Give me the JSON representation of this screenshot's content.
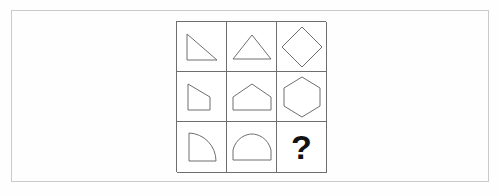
{
  "page": {
    "background_color": "#fefefe",
    "frame_color": "#c9cacc",
    "grid_line_color": "#6d6e70",
    "shape_stroke_color": "#6d6e70",
    "question_mark_color": "#121212"
  },
  "ghost_text": {
    "note": "faint scanner bleed-through from the reverse side of the page; illegible",
    "fragments": [
      "    ",
      "   ",
      "     ",
      "   ",
      "  ",
      "   ",
      "    ",
      "   "
    ]
  },
  "matrix": {
    "rows": 3,
    "columns": 3,
    "cells": [
      {
        "id": "r1c1",
        "row": 1,
        "column": 1,
        "shape": "right-triangle",
        "sides": 3,
        "label": "right triangle",
        "answer": false
      },
      {
        "id": "r1c2",
        "row": 1,
        "column": 2,
        "shape": "isosceles-triangle",
        "sides": 3,
        "label": "isosceles triangle",
        "answer": false
      },
      {
        "id": "r1c3",
        "row": 1,
        "column": 3,
        "shape": "diamond",
        "sides": 4,
        "label": "diamond",
        "answer": false
      },
      {
        "id": "r2c1",
        "row": 2,
        "column": 1,
        "shape": "trapezoid",
        "sides": 4,
        "label": "trapezoid",
        "answer": false
      },
      {
        "id": "r2c2",
        "row": 2,
        "column": 2,
        "shape": "pentagon",
        "sides": 5,
        "label": "pentagon",
        "answer": false
      },
      {
        "id": "r2c3",
        "row": 2,
        "column": 3,
        "shape": "hexagon",
        "sides": 6,
        "label": "hexagon",
        "answer": false
      },
      {
        "id": "r3c1",
        "row": 3,
        "column": 1,
        "shape": "quarter-circle",
        "sides": 3,
        "label": "quarter circle with curved hypotenuse",
        "answer": false
      },
      {
        "id": "r3c2",
        "row": 3,
        "column": 3,
        "shape": "dome",
        "sides": 4,
        "label": "dome / arch with curved top",
        "answer": false
      },
      {
        "id": "r3c3",
        "row": 3,
        "column": 3,
        "shape": "question-mark",
        "sides": 0,
        "label": "?",
        "answer": true
      }
    ],
    "answer_cell": {
      "text": "?",
      "position": "row 3, column 3"
    }
  }
}
